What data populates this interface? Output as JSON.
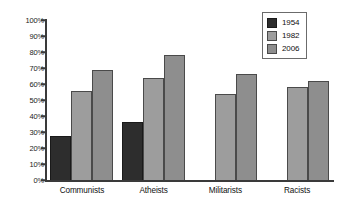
{
  "chart_data": {
    "type": "bar",
    "title": "",
    "xlabel": "",
    "ylabel": "",
    "ylim": [
      0,
      100
    ],
    "ytick_labels": [
      "100%",
      "90%",
      "80%",
      "70%",
      "60%",
      "50%",
      "40%",
      "30%",
      "20%",
      "10%",
      "0%"
    ],
    "ytick_values": [
      100,
      90,
      80,
      70,
      60,
      50,
      40,
      30,
      20,
      10,
      0
    ],
    "grid": false,
    "legend_position": "top-right",
    "categories": [
      "Communists",
      "Atheists",
      "Militarists",
      "Racists"
    ],
    "series": [
      {
        "name": "1954",
        "color": "#2d2d2d",
        "values": [
          27.5,
          36.5,
          null,
          null
        ]
      },
      {
        "name": "1982",
        "color": "#9d9d9d",
        "values": [
          55.5,
          64.0,
          54.0,
          58.0
        ]
      },
      {
        "name": "2006",
        "color": "#8e8e8e",
        "values": [
          69.0,
          78.0,
          66.0,
          62.0
        ]
      }
    ]
  },
  "axis": {
    "ticks": [
      {
        "label": "100%",
        "value": 100
      },
      {
        "label": "90%",
        "value": 90
      },
      {
        "label": "80%",
        "value": 80
      },
      {
        "label": "70%",
        "value": 70
      },
      {
        "label": "60%",
        "value": 60
      },
      {
        "label": "50%",
        "value": 50
      },
      {
        "label": "40%",
        "value": 40
      },
      {
        "label": "30%",
        "value": 30
      },
      {
        "label": "20%",
        "value": 20
      },
      {
        "label": "10%",
        "value": 10
      },
      {
        "label": "0%",
        "value": 0
      }
    ]
  },
  "legend": {
    "items": [
      {
        "label": "1954",
        "color": "#2d2d2d"
      },
      {
        "label": "1982",
        "color": "#9d9d9d"
      },
      {
        "label": "2006",
        "color": "#8e8e8e"
      }
    ]
  }
}
